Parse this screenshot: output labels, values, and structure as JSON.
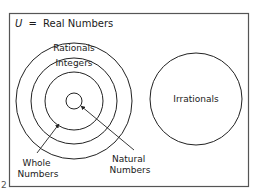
{
  "diagram": {
    "title": "U = Real Numbers",
    "title_parts": {
      "symbol": "U",
      "equals": "=",
      "text": "Real Numbers"
    },
    "edge_fragment": "2",
    "sets": [
      {
        "id": "rationals",
        "label": "Rationals",
        "shape": "circle",
        "cx": 74,
        "cy": 101,
        "r": 58
      },
      {
        "id": "integers",
        "label": "Integers",
        "shape": "circle",
        "cx": 74,
        "cy": 101,
        "r": 43
      },
      {
        "id": "whole-numbers",
        "label": "Whole Numbers",
        "label_lines": [
          "Whole",
          "Numbers"
        ],
        "shape": "circle",
        "cx": 74,
        "cy": 101,
        "r": 29
      },
      {
        "id": "natural-numbers",
        "label": "Natural Numbers",
        "label_lines": [
          "Natural",
          "Numbers"
        ],
        "shape": "circle",
        "cx": 74,
        "cy": 101,
        "r": 8
      },
      {
        "id": "irrationals",
        "label": "Irrationals",
        "shape": "circle",
        "cx": 196,
        "cy": 99,
        "r": 46
      }
    ],
    "relationships": [
      "Natural Numbers ⊂ Whole Numbers ⊂ Integers ⊂ Rationals",
      "Rationals and Irrationals are disjoint",
      "Rationals ∪ Irrationals = Real Numbers (U)"
    ],
    "arrows": [
      {
        "from_label": "Whole Numbers",
        "points_to": "whole-numbers"
      },
      {
        "from_label": "Natural Numbers",
        "points_to": "natural-numbers"
      }
    ],
    "colors": {
      "line": "#222222",
      "frame": "#555555",
      "text": "#1a1a1a",
      "background": "#ffffff"
    }
  }
}
